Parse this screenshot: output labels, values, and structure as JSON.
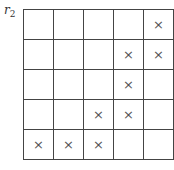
{
  "label": {
    "base": "r",
    "subscript": "2"
  },
  "grid": {
    "rows": 5,
    "cols": 5,
    "mark_symbol": "×",
    "marks": [
      [
        false,
        false,
        false,
        false,
        true
      ],
      [
        false,
        false,
        false,
        true,
        true
      ],
      [
        false,
        false,
        false,
        true,
        false
      ],
      [
        false,
        false,
        true,
        true,
        false
      ],
      [
        true,
        true,
        true,
        false,
        false
      ]
    ]
  }
}
